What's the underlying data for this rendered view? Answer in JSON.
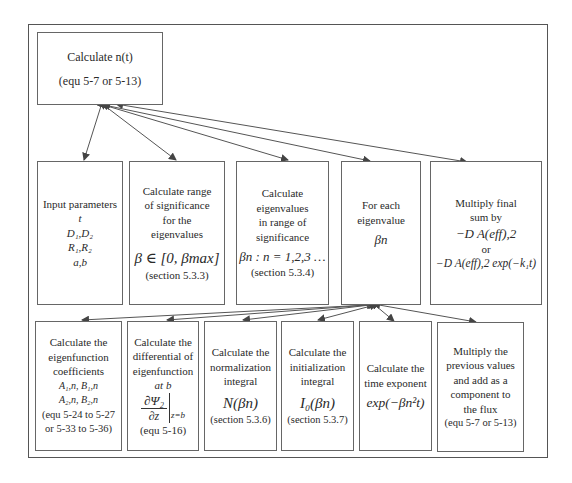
{
  "diagram": {
    "top_box": {
      "title": "Calculate n(t)",
      "subtitle": "(equ 5-7 or 5-13)"
    },
    "middle_row": [
      {
        "lines": [
          "Input parameters"
        ],
        "math": [
          "t",
          "D₁,D₂",
          "R₁,R₂",
          "a,b"
        ]
      },
      {
        "lines": [
          "Calculate range",
          "of significance",
          "for the",
          "eigenvalues"
        ],
        "math": [
          "β ∈ [0, βmax]"
        ],
        "ref": "(section 5.3.3)"
      },
      {
        "lines": [
          "Calculate",
          "eigenvalues",
          "in range of",
          "significance"
        ],
        "math": [
          "βn : n = 1,2,3 …"
        ],
        "ref": "(section 5.3.4)"
      },
      {
        "lines": [
          "For each",
          "eigenvalue"
        ],
        "math": [
          "βn"
        ]
      },
      {
        "lines": [
          "Multiply final",
          "sum by"
        ],
        "math": [
          "−D A(eff),2",
          "or",
          "−D A(eff),2 exp(−k₁t)"
        ]
      }
    ],
    "bottom_row": [
      {
        "lines": [
          "Calculate the",
          "eigenfunction",
          "coefficients"
        ],
        "math": [
          "A₁,n, B₁,n",
          "A₂,n, B₂,n"
        ],
        "ref": "(equ 5-24 to 5-27",
        "ref2": "or 5-33 to 5-36)"
      },
      {
        "lines": [
          "Calculate the",
          "differential of",
          "eigenfunction",
          "at b"
        ],
        "math": [
          "∂Ψ₂",
          "∂z",
          "z=b"
        ],
        "ref": "(equ 5-16)"
      },
      {
        "lines": [
          "Calculate the",
          "normalization",
          "integral"
        ],
        "math": [
          "N(βn)"
        ],
        "ref": "(section 5.3.6)"
      },
      {
        "lines": [
          "Calculate the",
          "initialization",
          "integral"
        ],
        "math": [
          "I₀(βn)"
        ],
        "ref": "(section 5.3.7)"
      },
      {
        "lines": [
          "Calculate the",
          "time exponent"
        ],
        "math": [
          "exp(−βn²t)"
        ]
      },
      {
        "lines": [
          "Multiply the",
          "previous values",
          "and add as a",
          "component to",
          "the flux",
          "(equ 5-7 or 5-13)"
        ]
      }
    ],
    "colors": {
      "line": "#555555",
      "text": "#2a2a2a",
      "background": "#ffffff"
    }
  }
}
